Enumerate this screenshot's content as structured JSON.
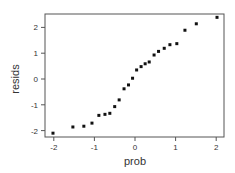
{
  "chart_data": {
    "type": "scatter",
    "title": "",
    "xlabel": "prob",
    "ylabel": "resids",
    "xlim": [
      -2.2,
      2.2
    ],
    "ylim": [
      -2.25,
      2.55
    ],
    "xticks": [
      -2,
      -1,
      0,
      1,
      2
    ],
    "yticks": [
      -2,
      -1,
      0,
      1,
      2
    ],
    "xtick_labels": [
      "-2",
      "-1",
      "0",
      "1",
      "2"
    ],
    "ytick_labels": [
      "-2",
      "-1",
      "0",
      "1",
      "2"
    ],
    "grid": false,
    "legend": null,
    "marker_color": "#111111",
    "points": [
      {
        "x": -2.02,
        "y": -2.1
      },
      {
        "x": -1.53,
        "y": -1.86
      },
      {
        "x": -1.26,
        "y": -1.83
      },
      {
        "x": -1.06,
        "y": -1.71
      },
      {
        "x": -0.89,
        "y": -1.41
      },
      {
        "x": -0.74,
        "y": -1.37
      },
      {
        "x": -0.62,
        "y": -1.33
      },
      {
        "x": -0.5,
        "y": -1.07
      },
      {
        "x": -0.39,
        "y": -0.81
      },
      {
        "x": -0.27,
        "y": -0.38
      },
      {
        "x": -0.16,
        "y": -0.23
      },
      {
        "x": -0.06,
        "y": 0.03
      },
      {
        "x": 0.04,
        "y": 0.35
      },
      {
        "x": 0.15,
        "y": 0.48
      },
      {
        "x": 0.25,
        "y": 0.59
      },
      {
        "x": 0.35,
        "y": 0.66
      },
      {
        "x": 0.47,
        "y": 0.93
      },
      {
        "x": 0.58,
        "y": 1.07
      },
      {
        "x": 0.72,
        "y": 1.19
      },
      {
        "x": 0.86,
        "y": 1.33
      },
      {
        "x": 1.03,
        "y": 1.37
      },
      {
        "x": 1.23,
        "y": 1.89
      },
      {
        "x": 1.51,
        "y": 2.14
      },
      {
        "x": 2.02,
        "y": 2.39
      }
    ]
  }
}
